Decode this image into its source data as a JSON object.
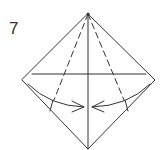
{
  "diagram": {
    "step_number": "7",
    "stroke_color": "#333333",
    "background": "#ffffff",
    "type": "origami-fold-step",
    "shape": "diamond",
    "vertices": {
      "top": [
        88,
        14
      ],
      "left": [
        22,
        80
      ],
      "right": [
        155,
        80
      ],
      "bottom": [
        88,
        149
      ]
    },
    "lines": [
      {
        "name": "center-vertical-crease",
        "style": "solid"
      },
      {
        "name": "horizontal-crease",
        "style": "solid"
      },
      {
        "name": "left-valley-fold",
        "style": "dashed"
      },
      {
        "name": "right-valley-fold",
        "style": "dashed"
      }
    ],
    "arrows": [
      {
        "name": "left-fold-arrow",
        "direction": "toward-center"
      },
      {
        "name": "right-fold-arrow",
        "direction": "toward-center"
      }
    ]
  }
}
